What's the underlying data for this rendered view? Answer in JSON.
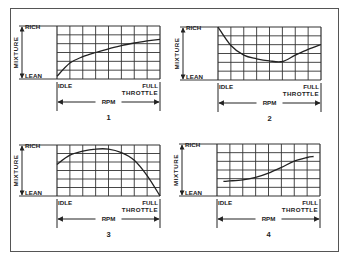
{
  "figure": {
    "panels": [
      {
        "id": "1",
        "number_label": "1",
        "y_top_label": "RICH",
        "y_bottom_label": "LEAN",
        "y_axis_label": "MIXTURE",
        "x_left_label": "IDLE",
        "x_right_label_1": "FULL",
        "x_right_label_2": "THROTTLE",
        "x_axis_label": "RPM"
      },
      {
        "id": "2",
        "number_label": "2",
        "y_top_label": "RICH",
        "y_bottom_label": "LEAN",
        "y_axis_label": "MIXTURE",
        "x_left_label": "IDLE",
        "x_right_label_1": "FULL",
        "x_right_label_2": "THROTTLE",
        "x_axis_label": "RPM"
      },
      {
        "id": "3",
        "number_label": "3",
        "y_top_label": "RICH",
        "y_bottom_label": "LEAN",
        "y_axis_label": "MIXTURE",
        "x_left_label": "IDLE",
        "x_right_label_1": "FULL",
        "x_right_label_2": "THROTTLE",
        "x_axis_label": "RPM"
      },
      {
        "id": "4",
        "number_label": "4",
        "y_top_label": "RICH",
        "y_bottom_label": "LEAN",
        "y_axis_label": "MIXTURE",
        "x_left_label": "IDLE",
        "x_right_label_1": "FULL",
        "x_right_label_2": "THROTTLE",
        "x_axis_label": "RPM"
      }
    ]
  },
  "chart_data": [
    {
      "type": "line",
      "title": "1",
      "xlabel": "RPM (IDLE → FULL THROTTLE)",
      "ylabel": "MIXTURE (LEAN → RICH)",
      "grid": true,
      "grid_cols": 8,
      "grid_rows": 6,
      "x": [
        0,
        1,
        2,
        3,
        4,
        5,
        6,
        7,
        8
      ],
      "y": [
        0.05,
        0.3,
        0.42,
        0.5,
        0.57,
        0.63,
        0.68,
        0.72,
        0.75
      ]
    },
    {
      "type": "line",
      "title": "2",
      "xlabel": "RPM (IDLE → FULL THROTTLE)",
      "ylabel": "MIXTURE (LEAN → RICH)",
      "grid": true,
      "grid_cols": 8,
      "grid_rows": 6,
      "x": [
        0,
        1,
        2,
        3,
        4,
        5,
        6,
        7,
        8
      ],
      "y": [
        1.0,
        0.65,
        0.47,
        0.4,
        0.36,
        0.35,
        0.47,
        0.58,
        0.67
      ]
    },
    {
      "type": "line",
      "title": "3",
      "xlabel": "RPM (IDLE → FULL THROTTLE)",
      "ylabel": "MIXTURE (LEAN → RICH)",
      "grid": true,
      "grid_cols": 8,
      "grid_rows": 6,
      "x": [
        0,
        1,
        2,
        3,
        4,
        5,
        6,
        7,
        8
      ],
      "y": [
        0.62,
        0.8,
        0.88,
        0.92,
        0.92,
        0.85,
        0.7,
        0.4,
        0.0
      ]
    },
    {
      "type": "line",
      "title": "4",
      "xlabel": "RPM (IDLE → FULL THROTTLE)",
      "ylabel": "MIXTURE (LEAN → RICH)",
      "grid": true,
      "grid_cols": 8,
      "grid_rows": 6,
      "x": [
        0.5,
        1,
        2,
        3,
        4,
        5,
        6,
        7,
        7.5
      ],
      "y": [
        0.28,
        0.29,
        0.31,
        0.36,
        0.44,
        0.55,
        0.67,
        0.74,
        0.76
      ]
    }
  ]
}
